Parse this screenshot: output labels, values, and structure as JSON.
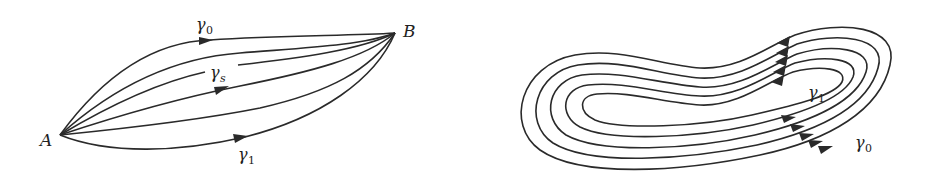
{
  "figures": [
    {
      "id": "homotopy-paths",
      "description": "Homotopy between paths γ0 and γ1 from A to B via intermediate paths γs",
      "points": {
        "start_label": "A",
        "end_label": "B"
      },
      "labels": {
        "top_path": {
          "symbol": "γ",
          "subscript": "0"
        },
        "middle_path": {
          "symbol": "γ",
          "subscript": "s"
        },
        "bottom_path": {
          "symbol": "γ",
          "subscript": "1"
        }
      },
      "path_count": 6
    },
    {
      "id": "homotopy-loops",
      "description": "Nested closed loops homotopic from γ0 (outer) to γ1 (inner)",
      "labels": {
        "inner_loop": {
          "symbol": "γ",
          "subscript": "1"
        },
        "outer_loop": {
          "symbol": "γ",
          "subscript": "0"
        }
      },
      "loop_count": 5
    }
  ],
  "colors": {
    "stroke": "#2a2a2a",
    "background": "#ffffff"
  }
}
